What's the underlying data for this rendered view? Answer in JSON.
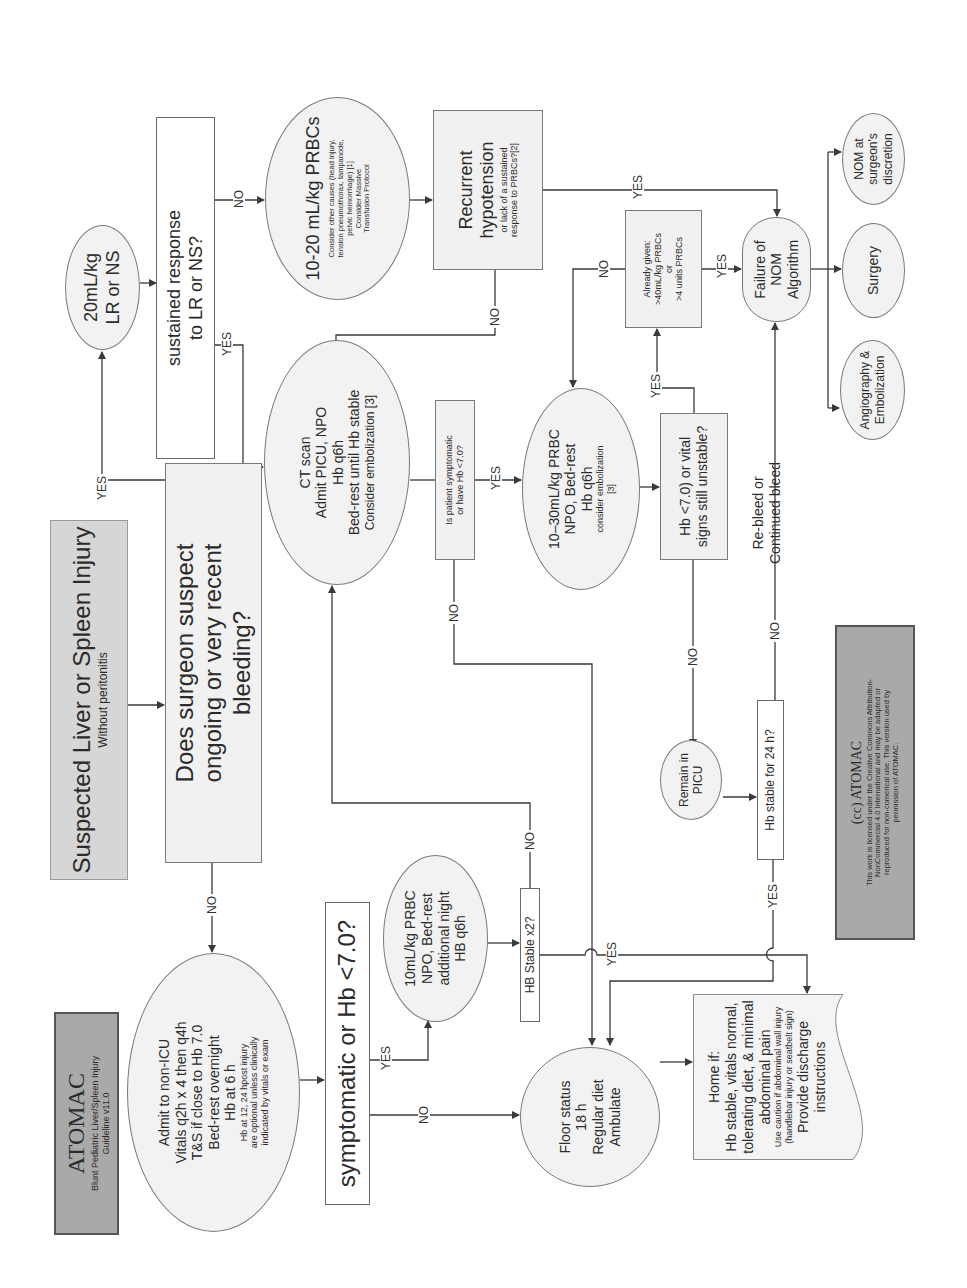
{
  "header": {
    "brand": "ATOMAC",
    "subtitle_line1": "Blunt Pediatric Liver/Spleen Injury",
    "subtitle_line2": "Guideline v11.0"
  },
  "start": {
    "title": "Suspected Liver or Spleen Injury",
    "subtitle": "Without peritonitis"
  },
  "decision_bleeding": {
    "line1": "Does surgeon suspect",
    "line2": "ongoing or very recent",
    "line3": "bleeding?"
  },
  "bolus": {
    "line1": "20mL/kg",
    "line2": "LR or NS"
  },
  "sustained": {
    "line1": "sustained response",
    "line2": "to LR or NS?"
  },
  "prbc_10_20": {
    "title": "10-20 mL/kg PRBCs",
    "note1": "Consider other causes (head injury,",
    "note2": "tension pneumothorax, tampanode,",
    "note3": "pelvic hemorrhage) [1]",
    "note4": "Consider Massive",
    "note5": "Transfusion Protocol"
  },
  "recurrent": {
    "line1": "Recurrent",
    "line2": "hypotension",
    "note1": "or lack of a  sustained",
    "note2": "response to PRBCs?[2]"
  },
  "ct_scan": {
    "line1": "CT scan",
    "line2": "Admit PICU, NPO",
    "line3": "Hb q6h",
    "line4": "Bed-rest until Hb stable",
    "line5": "Consider embolization [3]"
  },
  "is_symptomatic": {
    "line1": "Is patient symptomatic",
    "line2": "or have Hb <7.0?"
  },
  "prbc_10_30": {
    "line1": "10–30mL/kg PRBC",
    "line2": "NPO, Bed-rest",
    "line3": "Hb q6h",
    "line4": "consider embolization",
    "line5": "[3]"
  },
  "hb_unstable": {
    "line1": "Hb <7.0) or vital",
    "line2": "signs still unstable?"
  },
  "already_given": {
    "line1": "Already given:",
    "line2": ">40mL/kg PRBCs",
    "line3": "or",
    "line4": ">4 units PRBCs"
  },
  "failure": {
    "line1": "Failure of",
    "line2": "NOM",
    "line3": "Algorithm"
  },
  "outcomes": {
    "nom": {
      "line1": "NOM at",
      "line2": "surgeon's",
      "line3": "discretion"
    },
    "surgery": {
      "line1": "Surgery"
    },
    "angio": {
      "line1": "Angiography &",
      "line2": "Embolization"
    }
  },
  "remain_picu": {
    "line1": "Remain in",
    "line2": "PICU"
  },
  "hb_24h": {
    "label": "Hb stable for 24 h?"
  },
  "rebleed": {
    "line1": "Re-bleed or",
    "line2": "Continued bleed"
  },
  "admit_non_icu": {
    "line1": "Admit to non-ICU",
    "line2": "Vitals q2h x 4 then q4h",
    "line3": "T&S if close to Hb 7.0",
    "line4": "Bed-rest overnight",
    "line5": "Hb at 6 h",
    "note1": "Hb at 12, 24 hpost injury",
    "note2": "are optional unless clinically",
    "note3": "indicated by vitals or exam"
  },
  "symptomatic_q": {
    "label": "symptomatic or  Hb <7.0?"
  },
  "prbc_10": {
    "line1": "10mL/kg PRBC",
    "line2": "NPO, Bed-rest",
    "line3": "additional night",
    "line4": "HB q6h"
  },
  "hb_stable_x2": {
    "label": "HB Stable x2?"
  },
  "floor": {
    "line1": "Floor status",
    "line2": "18 h",
    "line3": "Regular diet",
    "line4": "Ambulate"
  },
  "home": {
    "line1": "Home if:",
    "line2": "Hb stable, vitals normal,",
    "line3": "tolerating diet, & minimal",
    "line4": "abdominal pain",
    "note1": "Use caution if abdominal wall injury",
    "note2": "(handlebar injury or seatbelt sign)",
    "line5": "Provide discharge instructions"
  },
  "license": {
    "title": "(cc)  ATOMAC",
    "line1": "This work is licensed under the Creative Commons Attribution-",
    "line2": "NonCommercial 4.0 International and may be adapted or",
    "line3": "reproduced for non-comerical use.  This version used by",
    "line4": "permission of ATOMAC."
  },
  "edge_labels": {
    "yes": "YES",
    "no": "NO"
  },
  "colors": {
    "line": "#3a3a3a",
    "box_fill": "#f1f1f1",
    "header_fill": "#a9a9a9",
    "start_fill": "#d6d6d6"
  }
}
